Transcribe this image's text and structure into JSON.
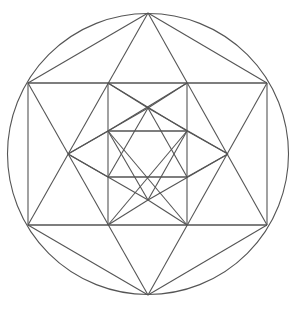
{
  "figure": {
    "title": "",
    "stroke_color": "#555555",
    "background": "#ffffff",
    "circle": {
      "cx": 148,
      "cy": 154,
      "r": 140.5
    },
    "outer_hexagon": [
      [
        148,
        13
      ],
      [
        267,
        83
      ],
      [
        267,
        225
      ],
      [
        148,
        295
      ],
      [
        28,
        225
      ],
      [
        28,
        83
      ]
    ],
    "outer_star": {
      "triangle_up": [
        [
          148,
          13
        ],
        [
          28,
          225
        ],
        [
          267,
          225
        ]
      ],
      "triangle_down": [
        [
          148,
          295
        ],
        [
          28,
          83
        ],
        [
          267,
          83
        ]
      ]
    },
    "middle_points": [
      [
        108,
        83
      ],
      [
        187,
        83
      ],
      [
        228,
        154
      ],
      [
        187,
        225
      ],
      [
        108,
        225
      ],
      [
        68,
        154
      ]
    ],
    "middle_star": {
      "triangle_up": [
        [
          148,
          108
        ],
        [
          68,
          154
        ]
      ],
      "note": "lines from middle hexagon vertices to inner points"
    },
    "inner_points": [
      [
        148,
        108
      ],
      [
        187,
        131
      ],
      [
        187,
        177
      ],
      [
        148,
        200
      ],
      [
        108,
        177
      ],
      [
        108,
        131
      ]
    ],
    "inner_square": [
      [
        108,
        131
      ],
      [
        187,
        131
      ],
      [
        187,
        177
      ],
      [
        108,
        177
      ]
    ]
  }
}
